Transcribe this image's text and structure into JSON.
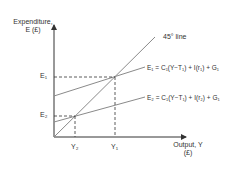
{
  "diagram": {
    "y_axis": {
      "label_line1": "Expenditure,",
      "label_line2": "E (£)"
    },
    "x_axis": {
      "label_line1": "Output, Y",
      "label_line2": "(£)"
    },
    "reference_line": {
      "label": "45° line"
    },
    "curves": [
      {
        "id": "E1",
        "label": "E₁ = C₁(Y−T₁) + I(r₁) + G₁"
      },
      {
        "id": "E2",
        "label": "E₂ = C₁(Y−T₁) + I(r₂) + G₁"
      }
    ],
    "ticks": {
      "y": [
        {
          "label": "E₁"
        },
        {
          "label": "E₂"
        }
      ],
      "x": [
        {
          "label": "Y₂"
        },
        {
          "label": "Y₁"
        }
      ]
    },
    "colors": {
      "axis": "#333333",
      "line": "#8a8a8a",
      "dash": "#333333"
    }
  }
}
